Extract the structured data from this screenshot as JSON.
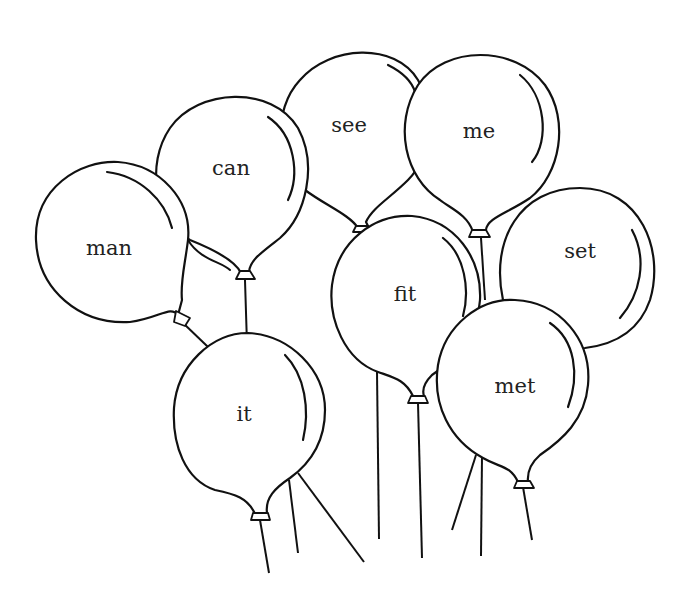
{
  "worksheet": {
    "title": "",
    "balloons": [
      {
        "id": "man",
        "word": "man"
      },
      {
        "id": "can",
        "word": "can"
      },
      {
        "id": "see",
        "word": "see"
      },
      {
        "id": "me",
        "word": "me"
      },
      {
        "id": "set",
        "word": "set"
      },
      {
        "id": "fit",
        "word": "fit"
      },
      {
        "id": "met",
        "word": "met"
      },
      {
        "id": "it",
        "word": "it"
      }
    ],
    "colors": {
      "line": "#111111",
      "fill": "#ffffff",
      "text": "#222222"
    }
  }
}
